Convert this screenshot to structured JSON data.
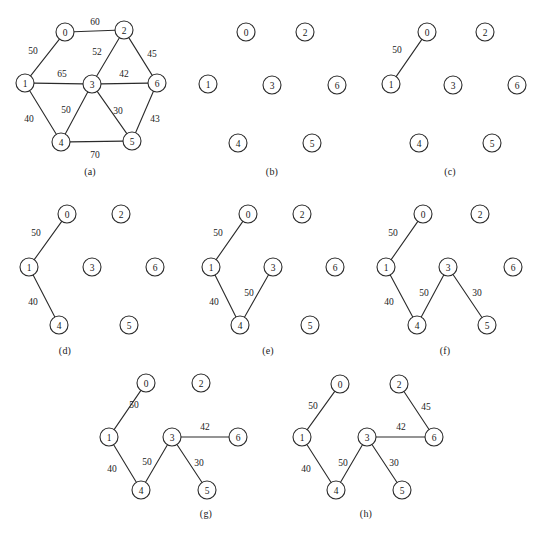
{
  "figure": {
    "title": "Minimum spanning tree construction",
    "node_radius": 9,
    "colors": {
      "background": "#ffffff",
      "stroke": "#2b2b2b",
      "text": "#1a1a1a"
    }
  },
  "chart_data": {
    "type": "diagram",
    "subtype": "weighted-undirected-graph-sequence",
    "title": "Minimum spanning tree construction",
    "nodes": [
      "0",
      "1",
      "2",
      "3",
      "4",
      "5",
      "6"
    ],
    "full_graph_edges": [
      {
        "from": "0",
        "to": "2",
        "weight": 60
      },
      {
        "from": "0",
        "to": "1",
        "weight": 50
      },
      {
        "from": "2",
        "to": "3",
        "weight": 52
      },
      {
        "from": "2",
        "to": "6",
        "weight": 45
      },
      {
        "from": "1",
        "to": "3",
        "weight": 65
      },
      {
        "from": "3",
        "to": "6",
        "weight": 42
      },
      {
        "from": "1",
        "to": "4",
        "weight": 40
      },
      {
        "from": "3",
        "to": "4",
        "weight": 50
      },
      {
        "from": "3",
        "to": "5",
        "weight": 30
      },
      {
        "from": "6",
        "to": "5",
        "weight": 43
      },
      {
        "from": "4",
        "to": "5",
        "weight": 70
      }
    ],
    "mst_edges_in_order": [
      {
        "from": "0",
        "to": "1",
        "weight": 50
      },
      {
        "from": "1",
        "to": "4",
        "weight": 40
      },
      {
        "from": "3",
        "to": "4",
        "weight": 50
      },
      {
        "from": "3",
        "to": "5",
        "weight": 30
      },
      {
        "from": "3",
        "to": "6",
        "weight": 42
      },
      {
        "from": "2",
        "to": "6",
        "weight": 45
      }
    ],
    "mst_total_weight": 257
  },
  "panels": [
    {
      "id": "a",
      "caption": "(a)",
      "caption_x": 70,
      "caption_y": 166,
      "origin_x": 0,
      "origin_y": 0,
      "width": 190,
      "height": 165,
      "nodes": [
        {
          "id": "0",
          "label": "0",
          "x": 65,
          "y": 32
        },
        {
          "id": "1",
          "label": "1",
          "x": 25,
          "y": 83
        },
        {
          "id": "2",
          "label": "2",
          "x": 124,
          "y": 30
        },
        {
          "id": "3",
          "label": "3",
          "x": 92,
          "y": 84
        },
        {
          "id": "4",
          "label": "4",
          "x": 61,
          "y": 142
        },
        {
          "id": "5",
          "label": "5",
          "x": 132,
          "y": 141
        },
        {
          "id": "6",
          "label": "6",
          "x": 157,
          "y": 83
        }
      ],
      "edges": [
        {
          "from": "0",
          "to": "2",
          "weight": "60",
          "lx": 95,
          "ly": 22
        },
        {
          "from": "0",
          "to": "1",
          "weight": "50",
          "lx": 33,
          "ly": 51
        },
        {
          "from": "2",
          "to": "3",
          "weight": "52",
          "lx": 97,
          "ly": 52
        },
        {
          "from": "2",
          "to": "6",
          "weight": "45",
          "lx": 152,
          "ly": 54
        },
        {
          "from": "1",
          "to": "3",
          "weight": "65",
          "lx": 62,
          "ly": 74
        },
        {
          "from": "3",
          "to": "6",
          "weight": "42",
          "lx": 124,
          "ly": 74
        },
        {
          "from": "1",
          "to": "4",
          "weight": "40",
          "lx": 29,
          "ly": 119
        },
        {
          "from": "3",
          "to": "4",
          "weight": "50",
          "lx": 66,
          "ly": 110
        },
        {
          "from": "3",
          "to": "5",
          "weight": "30",
          "lx": 118,
          "ly": 111
        },
        {
          "from": "6",
          "to": "5",
          "weight": "43",
          "lx": 155,
          "ly": 119
        },
        {
          "from": "4",
          "to": "5",
          "weight": "70",
          "lx": 95,
          "ly": 155
        }
      ]
    },
    {
      "id": "b",
      "caption": "(b)",
      "caption_x": 252,
      "caption_y": 166,
      "origin_x": 190,
      "origin_y": 0,
      "width": 175,
      "height": 165,
      "nodes": [
        {
          "id": "0",
          "label": "0",
          "x": 56,
          "y": 32
        },
        {
          "id": "1",
          "label": "1",
          "x": 18,
          "y": 84
        },
        {
          "id": "2",
          "label": "2",
          "x": 115,
          "y": 32
        },
        {
          "id": "3",
          "label": "3",
          "x": 82,
          "y": 85
        },
        {
          "id": "4",
          "label": "4",
          "x": 48,
          "y": 143
        },
        {
          "id": "5",
          "label": "5",
          "x": 122,
          "y": 143
        },
        {
          "id": "6",
          "label": "6",
          "x": 147,
          "y": 85
        }
      ],
      "edges": []
    },
    {
      "id": "c",
      "caption": "(c)",
      "caption_x": 430,
      "caption_y": 166,
      "origin_x": 365,
      "origin_y": 0,
      "width": 179,
      "height": 165,
      "nodes": [
        {
          "id": "0",
          "label": "0",
          "x": 62,
          "y": 32
        },
        {
          "id": "1",
          "label": "1",
          "x": 26,
          "y": 84
        },
        {
          "id": "2",
          "label": "2",
          "x": 120,
          "y": 32
        },
        {
          "id": "3",
          "label": "3",
          "x": 88,
          "y": 85
        },
        {
          "id": "4",
          "label": "4",
          "x": 54,
          "y": 143
        },
        {
          "id": "5",
          "label": "5",
          "x": 127,
          "y": 143
        },
        {
          "id": "6",
          "label": "6",
          "x": 152,
          "y": 85
        }
      ],
      "edges": [
        {
          "from": "0",
          "to": "1",
          "weight": "50",
          "lx": 32,
          "ly": 50
        }
      ]
    },
    {
      "id": "d",
      "caption": "(d)",
      "caption_x": 45,
      "caption_y": 345,
      "origin_x": 0,
      "origin_y": 190,
      "width": 190,
      "height": 155,
      "nodes": [
        {
          "id": "0",
          "label": "0",
          "x": 67,
          "y": 24
        },
        {
          "id": "1",
          "label": "1",
          "x": 29,
          "y": 77
        },
        {
          "id": "2",
          "label": "2",
          "x": 121,
          "y": 24
        },
        {
          "id": "3",
          "label": "3",
          "x": 92,
          "y": 77
        },
        {
          "id": "4",
          "label": "4",
          "x": 59,
          "y": 135
        },
        {
          "id": "5",
          "label": "5",
          "x": 129,
          "y": 135
        },
        {
          "id": "6",
          "label": "6",
          "x": 155,
          "y": 77
        }
      ],
      "edges": [
        {
          "from": "0",
          "to": "1",
          "weight": "50",
          "lx": 36,
          "ly": 43
        },
        {
          "from": "1",
          "to": "4",
          "weight": "40",
          "lx": 33,
          "ly": 112
        }
      ]
    },
    {
      "id": "e",
      "caption": "(e)",
      "caption_x": 248,
      "caption_y": 345,
      "origin_x": 185,
      "origin_y": 190,
      "width": 180,
      "height": 155,
      "nodes": [
        {
          "id": "0",
          "label": "0",
          "x": 63,
          "y": 24
        },
        {
          "id": "1",
          "label": "1",
          "x": 26,
          "y": 77
        },
        {
          "id": "2",
          "label": "2",
          "x": 117,
          "y": 24
        },
        {
          "id": "3",
          "label": "3",
          "x": 88,
          "y": 77
        },
        {
          "id": "4",
          "label": "4",
          "x": 55,
          "y": 135
        },
        {
          "id": "5",
          "label": "5",
          "x": 125,
          "y": 135
        },
        {
          "id": "6",
          "label": "6",
          "x": 150,
          "y": 77
        }
      ],
      "edges": [
        {
          "from": "0",
          "to": "1",
          "weight": "50",
          "lx": 33,
          "ly": 43
        },
        {
          "from": "1",
          "to": "4",
          "weight": "40",
          "lx": 29,
          "ly": 112
        },
        {
          "from": "3",
          "to": "4",
          "weight": "50",
          "lx": 64,
          "ly": 103
        }
      ]
    },
    {
      "id": "f",
      "caption": "(f)",
      "caption_x": 425,
      "caption_y": 345,
      "origin_x": 363,
      "origin_y": 190,
      "width": 181,
      "height": 155,
      "nodes": [
        {
          "id": "0",
          "label": "0",
          "x": 60,
          "y": 24
        },
        {
          "id": "1",
          "label": "1",
          "x": 23,
          "y": 77
        },
        {
          "id": "2",
          "label": "2",
          "x": 117,
          "y": 24
        },
        {
          "id": "3",
          "label": "3",
          "x": 85,
          "y": 77
        },
        {
          "id": "4",
          "label": "4",
          "x": 54,
          "y": 135
        },
        {
          "id": "5",
          "label": "5",
          "x": 124,
          "y": 135
        },
        {
          "id": "6",
          "label": "6",
          "x": 150,
          "y": 77
        }
      ],
      "edges": [
        {
          "from": "0",
          "to": "1",
          "weight": "50",
          "lx": 30,
          "ly": 43
        },
        {
          "from": "1",
          "to": "4",
          "weight": "40",
          "lx": 26,
          "ly": 112
        },
        {
          "from": "3",
          "to": "4",
          "weight": "50",
          "lx": 61,
          "ly": 103
        },
        {
          "from": "3",
          "to": "5",
          "weight": "30",
          "lx": 114,
          "ly": 103
        }
      ]
    },
    {
      "id": "g",
      "caption": "(g)",
      "caption_x": 186,
      "caption_y": 508,
      "origin_x": 95,
      "origin_y": 365,
      "width": 185,
      "height": 145,
      "nodes": [
        {
          "id": "0",
          "label": "0",
          "x": 51,
          "y": 18
        },
        {
          "id": "1",
          "label": "1",
          "x": 14,
          "y": 72
        },
        {
          "id": "2",
          "label": "2",
          "x": 106,
          "y": 18
        },
        {
          "id": "3",
          "label": "3",
          "x": 77,
          "y": 72
        },
        {
          "id": "4",
          "label": "4",
          "x": 46,
          "y": 125
        },
        {
          "id": "5",
          "label": "5",
          "x": 112,
          "y": 125
        },
        {
          "id": "6",
          "label": "6",
          "x": 143,
          "y": 72
        }
      ],
      "edges": [
        {
          "from": "0",
          "to": "1",
          "weight": "50",
          "lx": 39,
          "ly": 40
        },
        {
          "from": "1",
          "to": "4",
          "weight": "40",
          "lx": 17,
          "ly": 104
        },
        {
          "from": "3",
          "to": "4",
          "weight": "50",
          "lx": 52,
          "ly": 97
        },
        {
          "from": "3",
          "to": "5",
          "weight": "30",
          "lx": 104,
          "ly": 98
        },
        {
          "from": "3",
          "to": "6",
          "weight": "42",
          "lx": 110,
          "ly": 62
        }
      ]
    },
    {
      "id": "h",
      "caption": "(h)",
      "caption_x": 346,
      "caption_y": 508,
      "origin_x": 275,
      "origin_y": 365,
      "width": 185,
      "height": 145,
      "nodes": [
        {
          "id": "0",
          "label": "0",
          "x": 65,
          "y": 19
        },
        {
          "id": "1",
          "label": "1",
          "x": 27,
          "y": 72
        },
        {
          "id": "2",
          "label": "2",
          "x": 124,
          "y": 19
        },
        {
          "id": "3",
          "label": "3",
          "x": 92,
          "y": 72
        },
        {
          "id": "4",
          "label": "4",
          "x": 61,
          "y": 125
        },
        {
          "id": "5",
          "label": "5",
          "x": 127,
          "y": 125
        },
        {
          "id": "6",
          "label": "6",
          "x": 159,
          "y": 72
        }
      ],
      "edges": [
        {
          "from": "0",
          "to": "1",
          "weight": "50",
          "lx": 38,
          "ly": 41
        },
        {
          "from": "1",
          "to": "4",
          "weight": "40",
          "lx": 31,
          "ly": 104
        },
        {
          "from": "3",
          "to": "4",
          "weight": "50",
          "lx": 68,
          "ly": 98
        },
        {
          "from": "3",
          "to": "5",
          "weight": "30",
          "lx": 119,
          "ly": 98
        },
        {
          "from": "3",
          "to": "6",
          "weight": "42",
          "lx": 126,
          "ly": 62
        },
        {
          "from": "2",
          "to": "6",
          "weight": "45",
          "lx": 151,
          "ly": 42
        }
      ]
    }
  ]
}
